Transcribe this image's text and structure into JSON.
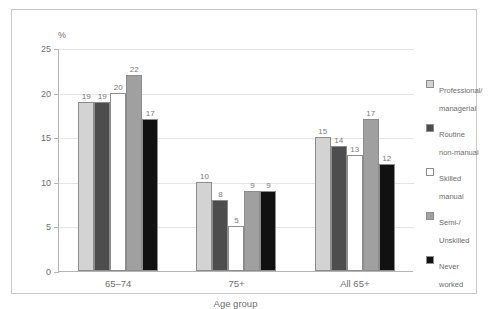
{
  "chart_data": {
    "type": "bar",
    "title": "",
    "xlabel": "Age group",
    "ylabel": "%",
    "ylim": [
      0,
      25
    ],
    "yticks": [
      0,
      5,
      10,
      15,
      20,
      25
    ],
    "ytick_labels": [
      "0",
      "5",
      "10",
      "15",
      "20",
      "25"
    ],
    "grid": true,
    "legend_position": "right",
    "categories": [
      "65–74",
      "75+",
      "All 65+"
    ],
    "series": [
      {
        "name": "Professional/\nmanagerial",
        "color": "#d3d3d3",
        "values": [
          19,
          10,
          15
        ]
      },
      {
        "name": "Routine\nnon-manual",
        "color": "#4d4d4d",
        "values": [
          19,
          8,
          14
        ]
      },
      {
        "name": "Skilled\nmanual",
        "color": "#ffffff",
        "values": [
          20,
          5,
          13
        ]
      },
      {
        "name": "Semi-/\nUnskilled",
        "color": "#a0a0a0",
        "values": [
          22,
          9,
          17
        ]
      },
      {
        "name": "Never\nworked",
        "color": "#111111",
        "values": [
          17,
          9,
          12
        ]
      }
    ]
  },
  "legend": {
    "items": [
      {
        "label": "Professional/\nmanagerial",
        "color": "#d3d3d3"
      },
      {
        "label": "Routine\nnon-manual",
        "color": "#4d4d4d"
      },
      {
        "label": "Skilled\nmanual",
        "color": "#ffffff"
      },
      {
        "label": "Semi-/\nUnskilled",
        "color": "#a0a0a0"
      },
      {
        "label": "Never\nworked",
        "color": "#111111"
      }
    ]
  },
  "axes": {
    "y_unit": "%",
    "x_title": "Age group"
  },
  "colors": {
    "frame": "#c8c8c8",
    "axis": "#b4b4b4",
    "grid": "#e4e4e4",
    "text": "#6e6e6e",
    "bar_border": "#8c8c8c"
  }
}
